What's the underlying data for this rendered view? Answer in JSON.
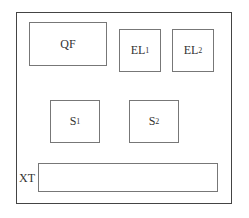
{
  "diagram": {
    "blocks": [
      {
        "id": "qf",
        "label": "QF",
        "sub": ""
      },
      {
        "id": "el1",
        "label": "EL",
        "sub": "1"
      },
      {
        "id": "el2",
        "label": "EL",
        "sub": "2"
      },
      {
        "id": "s1",
        "label": "S",
        "sub": "1"
      },
      {
        "id": "s2",
        "label": "S",
        "sub": "2"
      }
    ],
    "terminal": {
      "label": "XT"
    }
  }
}
